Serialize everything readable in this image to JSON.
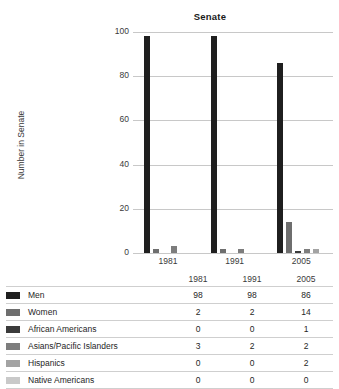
{
  "chart_data": {
    "type": "bar",
    "title": "Senate",
    "xlabel": "",
    "ylabel": "Number in Senate",
    "ylim": [
      0,
      100
    ],
    "yticks": [
      0,
      20,
      40,
      60,
      80,
      100
    ],
    "grid": true,
    "legend_position": "table-below",
    "categories": [
      "1981",
      "1991",
      "2005"
    ],
    "series": [
      {
        "name": "Men",
        "values": [
          98,
          98,
          86
        ],
        "color": "#1f1f1f"
      },
      {
        "name": "Women",
        "values": [
          2,
          2,
          14
        ],
        "color": "#6e6e6e"
      },
      {
        "name": "African Americans",
        "values": [
          0,
          0,
          1
        ],
        "color": "#3b3b3b"
      },
      {
        "name": "Asians/Pacific Islanders",
        "values": [
          3,
          2,
          2
        ],
        "color": "#7d7d7d"
      },
      {
        "name": "Hispanics",
        "values": [
          0,
          0,
          2
        ],
        "color": "#a3a3a3"
      },
      {
        "name": "Native Americans",
        "values": [
          0,
          0,
          0
        ],
        "color": "#c9c9c9"
      }
    ]
  },
  "chart": {
    "title": "Senate",
    "y_axis_title": "Number in Senate",
    "y_ticks": [
      "100",
      "80",
      "60",
      "40",
      "20",
      "0"
    ],
    "x_ticks": [
      "1981",
      "1991",
      "2005"
    ]
  },
  "table": {
    "columns": [
      "1981",
      "1991",
      "2005"
    ],
    "rows": [
      {
        "label": "Men",
        "swatch": "swatch-men",
        "values": [
          "98",
          "98",
          "86"
        ]
      },
      {
        "label": "Women",
        "swatch": "swatch-women",
        "values": [
          "2",
          "2",
          "14"
        ]
      },
      {
        "label": "African Americans",
        "swatch": "swatch-african-americans",
        "values": [
          "0",
          "0",
          "1"
        ]
      },
      {
        "label": "Asians/Pacific Islanders",
        "swatch": "swatch-asians-pacific",
        "values": [
          "3",
          "2",
          "2"
        ]
      },
      {
        "label": "Hispanics",
        "swatch": "swatch-hispanics",
        "values": [
          "0",
          "0",
          "2"
        ]
      },
      {
        "label": "Native Americans",
        "swatch": "swatch-native-americans",
        "values": [
          "0",
          "0",
          "0"
        ]
      }
    ]
  },
  "colors": {
    "men": "#1f1f1f",
    "women": "#6e6e6e",
    "african_americans": "#3b3b3b",
    "asians_pacific": "#7d7d7d",
    "hispanics": "#a3a3a3",
    "native_americans": "#c9c9c9",
    "gridline": "#c8c8c8",
    "rule": "#cfcfcf",
    "background": "#ffffff"
  }
}
